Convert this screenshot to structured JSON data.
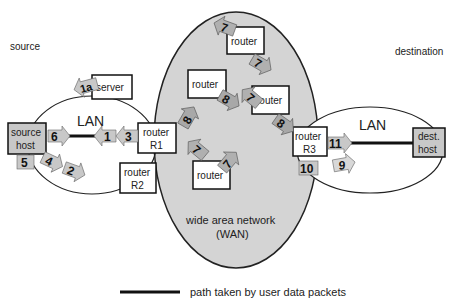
{
  "labels": {
    "source": "source",
    "destination": "destination",
    "lan_left": "LAN",
    "lan_right": "LAN",
    "wan_line1": "wide area network",
    "wan_line2": "(WAN)"
  },
  "nodes": {
    "source_host": {
      "line1": "source",
      "line2": "host"
    },
    "server": {
      "label": "server"
    },
    "router_r1": {
      "line1": "router",
      "line2": "R1"
    },
    "router_r2": {
      "line1": "router",
      "line2": "R2"
    },
    "router_r3": {
      "line1": "router",
      "line2": "R3"
    },
    "dest_host": {
      "line1": "dest.",
      "line2": "host"
    },
    "wan_router_top": {
      "label": "router"
    },
    "wan_router_left": {
      "label": "router"
    },
    "wan_router_mid": {
      "label": "router"
    },
    "wan_router_bottom": {
      "label": "router"
    }
  },
  "steps": {
    "s1a": "1a",
    "s1": "1",
    "s2": "2",
    "s3": "3",
    "s4": "4",
    "s5": "5",
    "s6": "6",
    "s7a": "7",
    "s7b": "7",
    "s7c": "7",
    "s7d": "7",
    "s7e": "7",
    "s8a": "8",
    "s8b": "8",
    "s8c": "8",
    "s9": "9",
    "s10": "10",
    "s11": "11"
  },
  "legend": {
    "text": "path taken by user data packets"
  },
  "colors": {
    "wan_fill": "#d4d4d4",
    "host_fill": "#c8c8c8",
    "arrow_light": "#c8c8c8",
    "arrow_dark": "#a8a8a8",
    "path_line": "#111111"
  }
}
